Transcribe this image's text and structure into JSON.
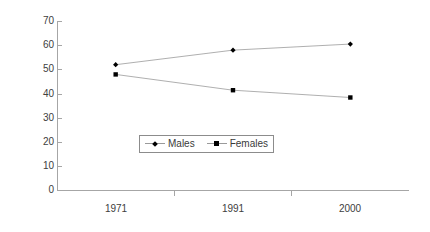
{
  "chart_data": {
    "type": "line",
    "title": "",
    "xlabel": "",
    "ylabel": "",
    "categories": [
      "1971",
      "1991",
      "2000"
    ],
    "ylim": [
      0,
      70
    ],
    "ytick_step": 10,
    "yticks": [
      "70",
      "60",
      "50",
      "40",
      "30",
      "20",
      "10",
      "0"
    ],
    "grid": false,
    "legend_position": "center",
    "series": [
      {
        "name": "Males",
        "marker": "diamond",
        "values": [
          52,
          58,
          60.5
        ]
      },
      {
        "name": "Females",
        "marker": "square",
        "values": [
          48,
          41.5,
          38.5
        ]
      }
    ],
    "colors": {
      "line": "#9a9a9a",
      "marker": "#000000",
      "axis": "#a6a6a6",
      "text": "#3a3a3a",
      "background": "#ffffff"
    }
  },
  "legend": {
    "entries": [
      {
        "label": "Males",
        "key": "diamond-marker-icon"
      },
      {
        "label": "Females",
        "key": "square-marker-icon"
      }
    ]
  },
  "axes": {
    "y": {
      "labels": [
        "70",
        "60",
        "50",
        "40",
        "30",
        "20",
        "10",
        "0"
      ]
    },
    "x": {
      "labels": [
        "1971",
        "1991",
        "2000"
      ]
    }
  }
}
